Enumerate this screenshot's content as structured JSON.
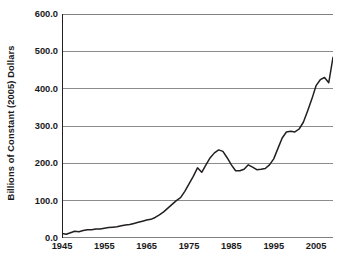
{
  "chart_data": {
    "type": "line",
    "title": "",
    "subtitle": "",
    "xlabel": "",
    "ylabel": "Billions of Constant (2005) Dollars",
    "xlim": [
      1945,
      2009
    ],
    "ylim": [
      0.0,
      600.0
    ],
    "grid": true,
    "legend": false,
    "legend_position": "none",
    "line_color": "#231f20",
    "axis_color": "#231f20",
    "grid_color": "#808080",
    "background_color": "#ffffff",
    "ytick_labels": [
      "0.0",
      "100.0",
      "200.0",
      "300.0",
      "400.0",
      "500.0",
      "600.0"
    ],
    "ytick_values": [
      0.0,
      100.0,
      200.0,
      300.0,
      400.0,
      500.0,
      600.0
    ],
    "xtick_labels": [
      "1945",
      "1955",
      "1965",
      "1975",
      "1985",
      "1995",
      "2005"
    ],
    "xtick_values": [
      1945,
      1955,
      1965,
      1975,
      1985,
      1995,
      2005
    ],
    "x": [
      1945,
      1946,
      1947,
      1948,
      1949,
      1950,
      1951,
      1952,
      1953,
      1954,
      1955,
      1956,
      1957,
      1958,
      1959,
      1960,
      1961,
      1962,
      1963,
      1964,
      1965,
      1966,
      1967,
      1968,
      1969,
      1970,
      1971,
      1972,
      1973,
      1974,
      1975,
      1976,
      1977,
      1978,
      1979,
      1980,
      1981,
      1982,
      1983,
      1984,
      1985,
      1986,
      1987,
      1988,
      1989,
      1990,
      1991,
      1992,
      1993,
      1994,
      1995,
      1996,
      1997,
      1998,
      1999,
      2000,
      2001,
      2002,
      2003,
      2004,
      2005,
      2006,
      2007,
      2008,
      2009
    ],
    "values": [
      12,
      10,
      14,
      18,
      17,
      20,
      22,
      22,
      24,
      24,
      26,
      28,
      29,
      30,
      33,
      35,
      36,
      39,
      42,
      45,
      48,
      50,
      55,
      62,
      70,
      80,
      90,
      100,
      108,
      125,
      145,
      165,
      188,
      176,
      196,
      215,
      228,
      236,
      232,
      215,
      196,
      180,
      180,
      184,
      196,
      190,
      183,
      184,
      186,
      196,
      212,
      240,
      268,
      284,
      286,
      284,
      292,
      310,
      340,
      372,
      408,
      424,
      430,
      416,
      484
    ],
    "series": [
      {
        "name": "expenditures",
        "values": [
          12,
          10,
          14,
          18,
          17,
          20,
          22,
          22,
          24,
          24,
          26,
          28,
          29,
          30,
          33,
          35,
          36,
          39,
          42,
          45,
          48,
          50,
          55,
          62,
          70,
          80,
          90,
          100,
          108,
          125,
          145,
          165,
          188,
          176,
          196,
          215,
          228,
          236,
          232,
          215,
          196,
          180,
          180,
          184,
          196,
          190,
          183,
          184,
          186,
          196,
          212,
          240,
          268,
          284,
          286,
          284,
          292,
          310,
          340,
          372,
          408,
          424,
          430,
          416,
          484
        ]
      }
    ],
    "annotations": []
  }
}
